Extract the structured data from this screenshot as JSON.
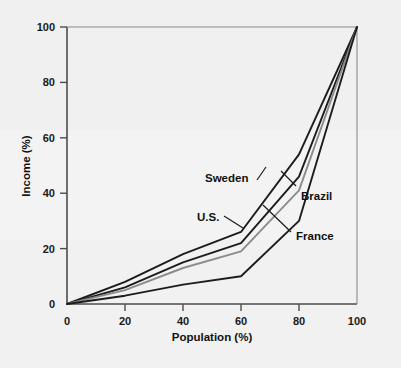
{
  "figure": {
    "background_color": "#f2f2f2",
    "plot_background_color": "#f2f2f2",
    "axis_color": "#4d4d4d",
    "text_color": "#111111"
  },
  "chart_data": {
    "type": "line",
    "title": "",
    "subtitle": "",
    "xlabel": "Population (%)",
    "ylabel": "Income (%)",
    "xlim": [
      0,
      100
    ],
    "ylim": [
      0,
      100
    ],
    "xticks": [
      0,
      20,
      40,
      60,
      80,
      100
    ],
    "yticks": [
      0,
      20,
      40,
      60,
      80,
      100
    ],
    "xtick_labels": [
      "0",
      "20",
      "40",
      "60",
      "80",
      "100"
    ],
    "ytick_labels": [
      "0",
      "20",
      "40",
      "60",
      "80",
      "100"
    ],
    "grid": false,
    "legend_position": "inline-annotations",
    "annotations": [
      {
        "text": "Sweden",
        "x_pct": 33,
        "y_pct": 50
      },
      {
        "text": "Brazil",
        "x_pct": 69,
        "y_pct": 41
      },
      {
        "text": "U.S.",
        "x_pct": 30,
        "y_pct": 34
      },
      {
        "text": "France",
        "x_pct": 69,
        "y_pct": 27
      }
    ],
    "series": [
      {
        "name": "Sweden",
        "color": "#1c1c1c",
        "x": [
          0,
          20,
          40,
          60,
          80,
          100
        ],
        "values": [
          0,
          8,
          18,
          26,
          54,
          100
        ]
      },
      {
        "name": "U.S.",
        "color": "#1c1c1c",
        "x": [
          0,
          20,
          40,
          60,
          80,
          100
        ],
        "values": [
          0,
          6,
          15,
          22,
          46,
          100
        ]
      },
      {
        "name": "France",
        "color": "#8c8c8c",
        "x": [
          0,
          20,
          40,
          60,
          80,
          100
        ],
        "values": [
          0,
          5,
          13,
          19,
          41,
          100
        ]
      },
      {
        "name": "Brazil",
        "color": "#1c1c1c",
        "x": [
          0,
          20,
          40,
          60,
          80,
          100
        ],
        "values": [
          0,
          3,
          7,
          10,
          30,
          100
        ]
      }
    ]
  }
}
